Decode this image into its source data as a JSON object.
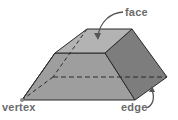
{
  "figure": {
    "labels": {
      "face": "face",
      "vertex": "vertex",
      "edge": "edge"
    },
    "colors": {
      "top_face": "#b3b3b3",
      "front_face": "#9e9e9e",
      "right_face": "#7d7d7d",
      "left_face": "#a9a9a9",
      "edge_stroke": "#2b2b2b",
      "hidden_edge": "#2b2b2b",
      "label_text": "#6b6b6b",
      "arrow": "#555555",
      "vertex_dot": "#8a8a8a"
    }
  }
}
